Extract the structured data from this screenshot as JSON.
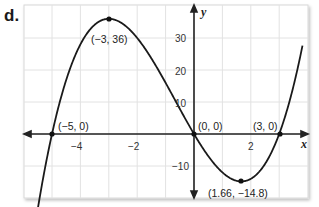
{
  "part_label": "d.",
  "chart_data": {
    "type": "line",
    "title": "",
    "function": "y = x(x + 5)(x - 3)",
    "xlabel": "x",
    "ylabel": "y",
    "xlim": [
      -6,
      4
    ],
    "ylim": [
      -20,
      40
    ],
    "grid": true,
    "x_grid_step": 1,
    "y_grid_step": 10,
    "x_tick_labels": [
      "-4",
      "-2",
      "2"
    ],
    "x_ticks": [
      -4,
      -2,
      2
    ],
    "y_tick_labels": [
      "30",
      "20",
      "10",
      "-10"
    ],
    "y_ticks": [
      30,
      20,
      10,
      -10
    ],
    "points": [
      {
        "x": -5,
        "y": 0,
        "label": "(−5, 0)"
      },
      {
        "x": -3,
        "y": 36,
        "label": "(−3, 36)"
      },
      {
        "x": 0,
        "y": 0,
        "label": "(0, 0)"
      },
      {
        "x": 1.66,
        "y": -14.8,
        "label": "(1.66, −14.8)"
      },
      {
        "x": 3,
        "y": 0,
        "label": "(3, 0)"
      }
    ],
    "colors": {
      "curve": "#1a1a1a",
      "grid": "#e2e2e2",
      "axes": "#222222"
    }
  },
  "labels": {
    "tick_x_m4": "−4",
    "tick_x_m2": "−2",
    "tick_x_2": "2",
    "tick_y_30": "30",
    "tick_y_20": "20",
    "tick_y_10": "10",
    "tick_y_m10": "−10",
    "axis_x": "x",
    "axis_y": "y",
    "pt_m5": "(−5, 0)",
    "pt_m3": "(−3, 36)",
    "pt_0": "(0, 0)",
    "pt_min": "(1.66, −14.8)",
    "pt_3": "(3, 0)"
  }
}
